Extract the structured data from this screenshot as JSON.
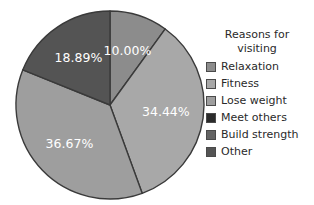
{
  "chart_data": {
    "type": "pie",
    "title": "",
    "legend_title": "Reasons for visiting",
    "legend_position": "right",
    "categories": [
      "Relaxation",
      "Fitness",
      "Lose weight",
      "Meet others",
      "Build strength",
      "Other"
    ],
    "values": [
      10.0,
      34.44,
      36.67,
      0,
      0,
      18.89
    ],
    "labels": [
      "10.00%",
      "34.44%",
      "36.67%",
      "",
      "",
      "18.89%"
    ],
    "colors": [
      "#8c8c8c",
      "#a8a8a8",
      "#9e9e9e",
      "#2b2b2b",
      "#636363",
      "#545454"
    ],
    "slice_label_color": "#ffffff",
    "outline_color": "#3a3a3a",
    "background": "#ffffff",
    "start_angle_deg": 0,
    "direction": "clockwise",
    "visible_slices": [
      {
        "label": "10.00%",
        "category": "Relaxation",
        "value": 10.0,
        "color": "#8c8c8c"
      },
      {
        "label": "34.44%",
        "category": "Fitness",
        "value": 34.44,
        "color": "#a8a8a8"
      },
      {
        "label": "36.67%",
        "category": "Lose weight",
        "value": 36.67,
        "color": "#9e9e9e"
      },
      {
        "label": "18.89%",
        "category": "Other",
        "value": 18.89,
        "color": "#545454"
      }
    ]
  },
  "legend": {
    "title_line1": "Reasons for",
    "title_line2": "visiting",
    "items": [
      {
        "label": "Relaxation",
        "color": "#8c8c8c"
      },
      {
        "label": "Fitness",
        "color": "#a8a8a8"
      },
      {
        "label": "Lose weight",
        "color": "#9e9e9e"
      },
      {
        "label": "Meet others",
        "color": "#2b2b2b"
      },
      {
        "label": "Build strength",
        "color": "#636363"
      },
      {
        "label": "Other",
        "color": "#545454"
      }
    ]
  }
}
